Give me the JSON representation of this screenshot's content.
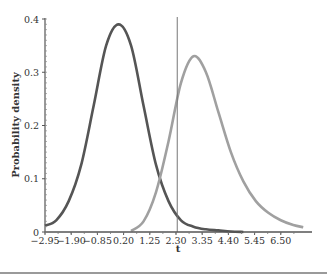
{
  "chart_data": {
    "type": "line",
    "title": "",
    "xlabel": "t",
    "ylabel": "Probability density",
    "xlim": [
      -2.95,
      7.4
    ],
    "ylim": [
      0,
      0.4
    ],
    "x_ticks": [
      "-2.95",
      "-1.90",
      "-0.85",
      "0.20",
      "1.25",
      "2.30",
      "3.35",
      "4.40",
      "5.45",
      "6.50"
    ],
    "y_ticks": [
      "0",
      "0.1",
      "0.2",
      "0.3",
      "0.4"
    ],
    "grid": false,
    "legend": null,
    "series": [
      {
        "name": "central t distribution (null)",
        "color": "#555555",
        "peak": {
          "t": 0.0,
          "density": 0.39
        },
        "x": [
          -2.95,
          -2.5,
          -2.0,
          -1.5,
          -1.0,
          -0.5,
          0.0,
          0.5,
          1.0,
          1.5,
          2.0,
          2.5,
          3.0,
          3.5,
          4.0,
          4.5,
          5.0
        ],
        "values": [
          0.012,
          0.022,
          0.058,
          0.126,
          0.237,
          0.35,
          0.39,
          0.35,
          0.237,
          0.126,
          0.058,
          0.022,
          0.01,
          0.005,
          0.003,
          0.001,
          0.0
        ]
      },
      {
        "name": "noncentral t distribution (alternative)",
        "color": "#a0a0a0",
        "peak": {
          "t": 2.95,
          "density": 0.33
        },
        "x": [
          0.5,
          1.0,
          1.5,
          2.0,
          2.5,
          3.0,
          3.5,
          4.0,
          4.5,
          5.0,
          5.5,
          6.0,
          6.5,
          7.0,
          7.4
        ],
        "values": [
          0.002,
          0.02,
          0.075,
          0.17,
          0.28,
          0.33,
          0.3,
          0.225,
          0.15,
          0.095,
          0.058,
          0.036,
          0.022,
          0.013,
          0.009
        ]
      }
    ],
    "annotations": [
      {
        "type": "vline",
        "x": 2.35,
        "label": "critical value",
        "color": "#777777"
      }
    ]
  }
}
